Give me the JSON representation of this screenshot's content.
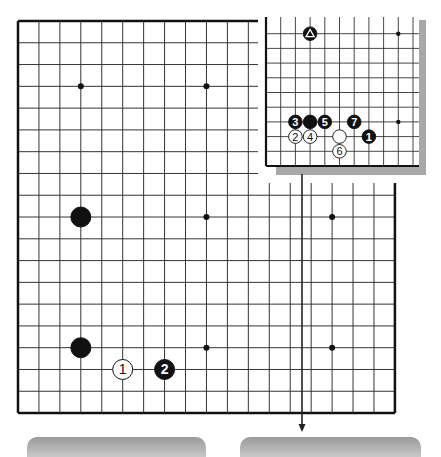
{
  "main_board": {
    "size": 19,
    "origin": {
      "x": 18,
      "y": 21
    },
    "spacing": {
      "x": 20.94,
      "y": 21.78
    },
    "star_points": [
      [
        3,
        3
      ],
      [
        9,
        3
      ],
      [
        3,
        9
      ],
      [
        9,
        9
      ],
      [
        15,
        9
      ],
      [
        3,
        15
      ],
      [
        9,
        15
      ],
      [
        15,
        15
      ]
    ],
    "stones": [
      {
        "col": 3,
        "row": 9,
        "color": "black",
        "label": ""
      },
      {
        "col": 3,
        "row": 15,
        "color": "black",
        "label": ""
      },
      {
        "col": 5,
        "row": 16,
        "color": "white",
        "label": "1"
      },
      {
        "col": 7,
        "row": 16,
        "color": "black",
        "label": "2"
      }
    ]
  },
  "inset_board": {
    "origin": {
      "x": 266,
      "y": 166
    },
    "spacing": 14.7,
    "cols": 11,
    "rows": 10,
    "star_points": [
      [
        9,
        9
      ],
      [
        9,
        3
      ]
    ],
    "stones": [
      {
        "col": 3,
        "row": 9,
        "color": "black",
        "label": "",
        "marker": "triangle"
      },
      {
        "col": 6,
        "row": 3,
        "color": "black",
        "label": "7"
      },
      {
        "col": 2,
        "row": 3,
        "color": "black",
        "label": "3"
      },
      {
        "col": 3,
        "row": 3,
        "color": "black",
        "label": ""
      },
      {
        "col": 4,
        "row": 3,
        "color": "black",
        "label": "5"
      },
      {
        "col": 2,
        "row": 2,
        "color": "white",
        "label": "2"
      },
      {
        "col": 3,
        "row": 2,
        "color": "white",
        "label": "4"
      },
      {
        "col": 5,
        "row": 2,
        "color": "white",
        "label": ""
      },
      {
        "col": 5,
        "row": 1,
        "color": "white",
        "label": "6"
      },
      {
        "col": 7,
        "row": 2,
        "color": "black",
        "label": "1"
      }
    ]
  },
  "arrow": {
    "x": 302,
    "y1": 174,
    "y2": 432
  },
  "colors": {
    "line": "#333333",
    "border": "#111111",
    "black_stone": "#111111",
    "white_stone": "#ffffff",
    "shadow": "#a8a8a8"
  },
  "panels": [
    {
      "left": 27,
      "width": 179
    },
    {
      "left": 240,
      "width": 181
    }
  ]
}
